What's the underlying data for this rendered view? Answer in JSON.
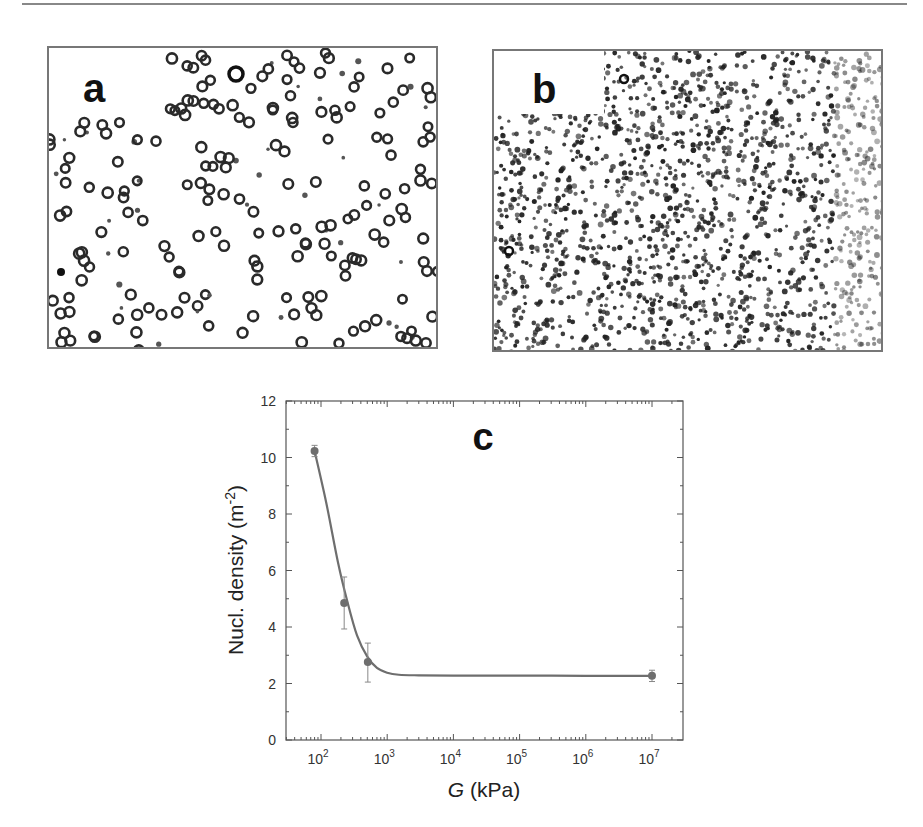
{
  "panels": [
    {
      "label": "a",
      "description": "sparse ring-shaped nuclei micrograph"
    },
    {
      "label": "b",
      "description": "dense dot-shaped nuclei micrograph"
    }
  ],
  "chart_data": {
    "type": "scatter",
    "panel_label": "c",
    "title": "",
    "xlabel": "G (kPa)",
    "xlabel_italic_part": "G",
    "xlabel_rest": " (kPa)",
    "ylabel": "Nucl. density (m^-2)",
    "ylabel_main": "Nucl. density (m",
    "ylabel_sup": "-2",
    "ylabel_close": ")",
    "xscale": "log",
    "xlim": [
      30,
      30000000
    ],
    "ylim": [
      0,
      12
    ],
    "x_ticks": [
      {
        "base": "10",
        "exp": "2",
        "value": 100
      },
      {
        "base": "10",
        "exp": "3",
        "value": 1000
      },
      {
        "base": "10",
        "exp": "4",
        "value": 10000
      },
      {
        "base": "10",
        "exp": "5",
        "value": 100000
      },
      {
        "base": "10",
        "exp": "6",
        "value": 1000000
      },
      {
        "base": "10",
        "exp": "7",
        "value": 10000000
      }
    ],
    "y_ticks": [
      "0",
      "2",
      "4",
      "6",
      "8",
      "10",
      "12"
    ],
    "grid": false,
    "series": [
      {
        "name": "measured",
        "marker": "circle",
        "color": "#6e6e6e",
        "x": [
          80,
          224,
          510,
          10000000
        ],
        "y": [
          10.23,
          4.85,
          2.76,
          2.27
        ],
        "yerr_low": [
          0.2,
          0.92,
          0.71,
          0.2
        ],
        "yerr_high": [
          0.2,
          0.92,
          0.67,
          0.2
        ]
      },
      {
        "name": "fit",
        "line": "solid",
        "color": "#6e6e6e",
        "x": [
          80,
          120,
          180,
          250,
          350,
          500,
          700,
          1000,
          1500,
          3000,
          10000,
          100000,
          1000000,
          10000000
        ],
        "y": [
          10.23,
          8.4,
          6.3,
          4.9,
          3.7,
          2.95,
          2.55,
          2.38,
          2.31,
          2.29,
          2.28,
          2.28,
          2.27,
          2.27
        ]
      }
    ]
  }
}
